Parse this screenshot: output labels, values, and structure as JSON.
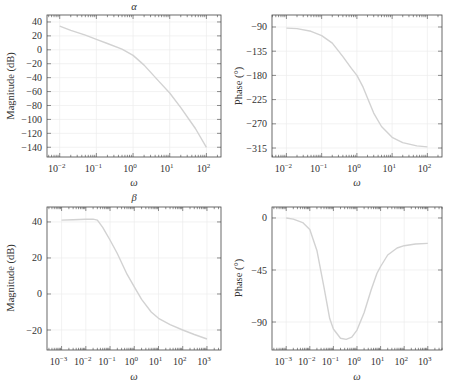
{
  "figure": {
    "width": 453,
    "height": 391,
    "colors": {
      "curve": "#d2d2d2",
      "grid": "#ececec",
      "frame": "#444444",
      "text": "#333333"
    }
  },
  "chart_data": [
    {
      "id": "alpha-magnitude",
      "type": "line",
      "title": "α",
      "xlabel": "ω",
      "ylabel": "Magnitude (dB)",
      "xscale": "log",
      "frame": {
        "left": 47,
        "top": 15,
        "right": 221,
        "bottom": 157
      },
      "xlim": [
        0.0045,
        250
      ],
      "ylim": [
        -154,
        50
      ],
      "xticks": [
        0.01,
        0.1,
        1,
        10,
        100
      ],
      "xtick_labels": [
        "10",
        "10",
        "10",
        "10",
        "10"
      ],
      "xtick_exps": [
        "−2",
        "−1",
        "0",
        "1",
        "2"
      ],
      "yticks": [
        40,
        20,
        0,
        -20,
        -40,
        -60,
        -80,
        -100,
        -120,
        -140
      ],
      "ytick_labels": [
        "40",
        "20",
        "0",
        "−20",
        "−40",
        "−60",
        "−80",
        "−100",
        "−120",
        "−140"
      ],
      "grid": true,
      "series": [
        {
          "name": "alpha magnitude",
          "x": [
            0.01,
            0.02,
            0.05,
            0.1,
            0.2,
            0.5,
            1,
            2,
            5,
            10,
            20,
            50,
            100
          ],
          "y": [
            34,
            28,
            21,
            15,
            9,
            1,
            -8,
            -22,
            -45,
            -62,
            -83,
            -113,
            -140
          ]
        }
      ]
    },
    {
      "id": "alpha-phase",
      "type": "line",
      "title": "",
      "xlabel": "ω",
      "ylabel": "Phase (°)",
      "xscale": "log",
      "frame": {
        "left": 272,
        "top": 15,
        "right": 442,
        "bottom": 157
      },
      "xlim": [
        0.0039,
        260
      ],
      "ylim": [
        -331.7,
        -67.7
      ],
      "xticks": [
        0.01,
        0.1,
        1,
        10,
        100
      ],
      "xtick_labels": [
        "10",
        "10",
        "10",
        "10",
        "10"
      ],
      "xtick_exps": [
        "−2",
        "−1",
        "0",
        "1",
        "2"
      ],
      "yticks": [
        -90,
        -135,
        -180,
        -225,
        -270,
        -315
      ],
      "ytick_labels": [
        "−90",
        "−135",
        "−180",
        "−225",
        "−270",
        "−315"
      ],
      "grid": true,
      "series": [
        {
          "name": "alpha phase",
          "x": [
            0.01,
            0.02,
            0.05,
            0.1,
            0.2,
            0.4,
            0.7,
            1,
            1.5,
            2,
            3,
            5,
            10,
            20,
            50,
            100
          ],
          "y": [
            -92,
            -93,
            -98,
            -106,
            -120,
            -145,
            -167,
            -180,
            -202,
            -222,
            -250,
            -275,
            -295,
            -305,
            -311,
            -313
          ]
        }
      ]
    },
    {
      "id": "beta-magnitude",
      "type": "line",
      "title": "β",
      "xlabel": "ω",
      "ylabel": "Magnitude (dB)",
      "xscale": "log",
      "frame": {
        "left": 47,
        "top": 207,
        "right": 221,
        "bottom": 350
      },
      "xlim": [
        0.00025,
        3800
      ],
      "ylim": [
        -31.1,
        48.3
      ],
      "xticks": [
        0.001,
        0.01,
        0.1,
        1,
        10,
        100,
        1000
      ],
      "xtick_labels": [
        "10",
        "10",
        "10",
        "10",
        "10",
        "10",
        "10"
      ],
      "xtick_exps": [
        "−3",
        "−2",
        "−1",
        "0",
        "1",
        "2",
        "3"
      ],
      "yticks": [
        40,
        20,
        0,
        -20
      ],
      "ytick_labels": [
        "40",
        "20",
        "0",
        "−20"
      ],
      "grid": true,
      "series": [
        {
          "name": "beta magnitude",
          "x": [
            0.001,
            0.003,
            0.01,
            0.02,
            0.03,
            0.05,
            0.1,
            0.2,
            0.5,
            1,
            2,
            5,
            10,
            30,
            100,
            300,
            1000
          ],
          "y": [
            41,
            41.2,
            41.5,
            41.6,
            41,
            37,
            30,
            22.5,
            11,
            4,
            -3,
            -10,
            -13.5,
            -17,
            -20,
            -22.5,
            -25
          ]
        }
      ]
    },
    {
      "id": "beta-phase",
      "type": "line",
      "title": "",
      "xlabel": "ω",
      "ylabel": "Phase (°)",
      "xscale": "log",
      "frame": {
        "left": 272,
        "top": 207,
        "right": 442,
        "bottom": 350
      },
      "xlim": [
        0.00025,
        4000
      ],
      "ylim": [
        -114.2,
        9.5
      ],
      "xticks": [
        0.001,
        0.01,
        0.1,
        1,
        10,
        100,
        1000
      ],
      "xtick_labels": [
        "10",
        "10",
        "10",
        "10",
        "10",
        "10",
        "10"
      ],
      "xtick_exps": [
        "−3",
        "−2",
        "−1",
        "0",
        "1",
        "2",
        "3"
      ],
      "yticks": [
        0,
        -45,
        -90
      ],
      "ytick_labels": [
        "0",
        "−45",
        "−90"
      ],
      "grid": true,
      "series": [
        {
          "name": "beta phase",
          "x": [
            0.001,
            0.002,
            0.005,
            0.01,
            0.02,
            0.04,
            0.07,
            0.1,
            0.2,
            0.35,
            0.6,
            1,
            2,
            4,
            7,
            10,
            20,
            50,
            100,
            300,
            1000
          ],
          "y": [
            0,
            -1,
            -4,
            -10,
            -28,
            -60,
            -87,
            -96,
            -104,
            -105,
            -103,
            -97,
            -82,
            -62,
            -48,
            -42,
            -32,
            -26,
            -24,
            -22.5,
            -22
          ]
        }
      ]
    }
  ]
}
